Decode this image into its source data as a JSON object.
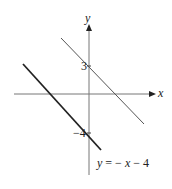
{
  "figure": {
    "type": "coordinate-graph",
    "axes": {
      "x_label": "x",
      "y_label": "y"
    },
    "lines": [
      {
        "name": "upper-line",
        "y_intercept_label": "3",
        "slope": -1,
        "intercept": 3,
        "stroke": "#555555",
        "width": 1
      },
      {
        "name": "lower-line",
        "y_intercept_label": "−4",
        "slope": -1,
        "intercept": -4,
        "stroke": "#222222",
        "width": 1.8,
        "equation_label": "y = − x − 4"
      }
    ]
  },
  "labels": {
    "x_axis": "x",
    "y_axis": "y",
    "tick_3": "3",
    "tick_neg4": "−4",
    "eq_y": "y",
    "eq_rest": " = − ",
    "eq_x": "x",
    "eq_tail": " − 4"
  },
  "colors": {
    "axis": "#666666",
    "upper_line": "#555555",
    "lower_line": "#222222",
    "text": "#222222"
  }
}
